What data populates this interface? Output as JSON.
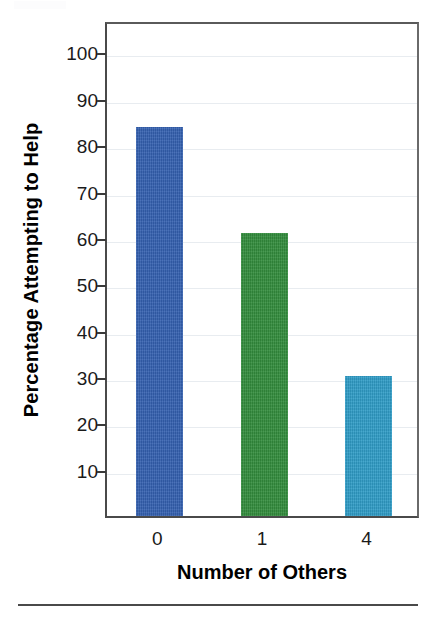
{
  "figure": {
    "background_color": "#ffffff",
    "bottom_rule_color": "#4a4a4a"
  },
  "chart_data": {
    "type": "bar",
    "title": "",
    "subtitle": "",
    "xlabel": "Number of Others",
    "ylabel": "Percentage Attempting to Help",
    "categories": [
      "0",
      "1",
      "4"
    ],
    "values": [
      84,
      61,
      30.3
    ],
    "series": [
      {
        "name": "Percentage Attempting to Help",
        "values": [
          84,
          61,
          30.3
        ]
      }
    ],
    "bar_colors": [
      "#3460b0",
      "#328c3c",
      "#2f9cc6"
    ],
    "ylim": [
      0,
      107
    ],
    "xlim": [
      0,
      3
    ],
    "y_ticks": [
      10,
      20,
      30,
      40,
      50,
      60,
      70,
      80,
      90,
      100
    ],
    "y_tick_labels": [
      "10",
      "20",
      "30",
      "40",
      "50",
      "60",
      "70",
      "80",
      "90",
      "100"
    ],
    "x_tick_labels": [
      "0",
      "1",
      "4"
    ],
    "grid": "horizontal-faint",
    "gridline_color": "#e8ecf0",
    "legend": "none",
    "annotations": [],
    "axis_frame": "full-box",
    "axis_color": "#4a4a4a"
  },
  "axes": {
    "y_title": "Percentage Attempting to Help",
    "x_title": "Number of Others"
  }
}
